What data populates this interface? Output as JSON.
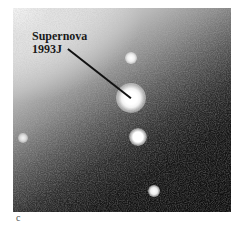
{
  "figure": {
    "label_line1": "Supernova",
    "label_line2": "1993J",
    "caption_letter": "c"
  },
  "colors": {
    "background": "#ffffff",
    "label_text": "#1a1a1a",
    "pointer_line": "#111111",
    "star_core": "#ffffff"
  },
  "stars": [
    {
      "name": "supernova-1993j",
      "x": 118,
      "y": 90,
      "r": 12
    },
    {
      "name": "star-top",
      "x": 118,
      "y": 50,
      "r": 4
    },
    {
      "name": "star-middle",
      "x": 125,
      "y": 129,
      "r": 7
    },
    {
      "name": "star-bottom",
      "x": 141,
      "y": 183,
      "r": 4
    },
    {
      "name": "star-left",
      "x": 10,
      "y": 130,
      "r": 3
    }
  ]
}
